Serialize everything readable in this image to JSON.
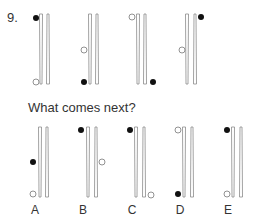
{
  "question": {
    "number": "9.",
    "prompt": "What comes next?"
  },
  "colors": {
    "bar_stroke": "#8a8a8a",
    "dot_filled": "#111111",
    "dot_hollow_stroke": "#777777"
  },
  "sequence": [
    {
      "id": "fig1",
      "bars_x": [
        41,
        48
      ],
      "bars_y": [
        14,
        84
      ],
      "dots": [
        {
          "type": "filled",
          "x": 36,
          "y": 18
        },
        {
          "type": "hollow",
          "x": 36,
          "y": 82
        }
      ]
    },
    {
      "id": "fig2",
      "bars_x": [
        90,
        97
      ],
      "bars_y": [
        14,
        84
      ],
      "dots": [
        {
          "type": "hollow",
          "x": 84,
          "y": 50
        },
        {
          "type": "filled",
          "x": 84,
          "y": 82
        }
      ]
    },
    {
      "id": "fig3",
      "bars_x": [
        138,
        145
      ],
      "bars_y": [
        14,
        84
      ],
      "dots": [
        {
          "type": "hollow",
          "x": 132,
          "y": 17
        },
        {
          "type": "filled",
          "x": 153,
          "y": 82
        }
      ]
    },
    {
      "id": "fig4",
      "bars_x": [
        187,
        195
      ],
      "bars_y": [
        14,
        84
      ],
      "dots": [
        {
          "type": "filled",
          "x": 201,
          "y": 17
        },
        {
          "type": "hollow",
          "x": 182,
          "y": 50
        }
      ]
    }
  ],
  "options": [
    {
      "label": "A",
      "label_x": 35,
      "bars_x": [
        40,
        47
      ],
      "bars_y": [
        127,
        197
      ],
      "dots": [
        {
          "type": "filled",
          "x": 33,
          "y": 162
        },
        {
          "type": "hollow",
          "x": 33,
          "y": 194
        }
      ]
    },
    {
      "label": "B",
      "label_x": 83,
      "bars_x": [
        88,
        96
      ],
      "bars_y": [
        127,
        197
      ],
      "dots": [
        {
          "type": "filled",
          "x": 81,
          "y": 130
        },
        {
          "type": "hollow",
          "x": 102,
          "y": 162
        }
      ]
    },
    {
      "label": "C",
      "label_x": 132,
      "bars_x": [
        136,
        144
      ],
      "bars_y": [
        127,
        197
      ],
      "dots": [
        {
          "type": "filled",
          "x": 130,
          "y": 130
        },
        {
          "type": "hollow",
          "x": 151,
          "y": 195
        }
      ]
    },
    {
      "label": "D",
      "label_x": 180,
      "bars_x": [
        184,
        192
      ],
      "bars_y": [
        127,
        197
      ],
      "dots": [
        {
          "type": "hollow",
          "x": 178,
          "y": 130
        },
        {
          "type": "filled",
          "x": 178,
          "y": 194
        }
      ]
    },
    {
      "label": "E",
      "label_x": 228,
      "bars_x": [
        233,
        241
      ],
      "bars_y": [
        127,
        197
      ],
      "dots": [
        {
          "type": "filled",
          "x": 227,
          "y": 130
        },
        {
          "type": "hollow",
          "x": 227,
          "y": 194
        }
      ]
    }
  ]
}
